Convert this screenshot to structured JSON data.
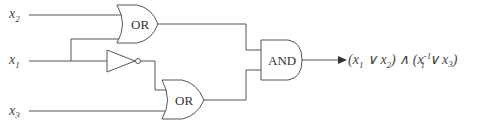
{
  "diagram": {
    "type": "logic-circuit",
    "inputs": [
      {
        "name": "x2",
        "base": "x",
        "sub": "2"
      },
      {
        "name": "x1",
        "base": "x",
        "sub": "1"
      },
      {
        "name": "x3",
        "base": "x",
        "sub": "3"
      }
    ],
    "gates": {
      "or_top": {
        "label": "OR"
      },
      "not": {
        "label": ""
      },
      "or_bottom": {
        "label": "OR"
      },
      "and": {
        "label": "AND"
      }
    },
    "output": {
      "expression": "(x1 ∨ x2) ∧ (x1^-1 ∨ x3)",
      "parts": {
        "open1": "(x",
        "s1": "1",
        "or1": " ∨ x",
        "s2": "2",
        "close1": ")",
        "and": " ∧ ",
        "open2": "(x",
        "sup": "-1",
        "s3": "1",
        "or2": " ∨ x",
        "s4": "3",
        "close2": ")"
      }
    },
    "colors": {
      "line": "#555555",
      "text": "#333333",
      "background": "#ffffff"
    }
  }
}
